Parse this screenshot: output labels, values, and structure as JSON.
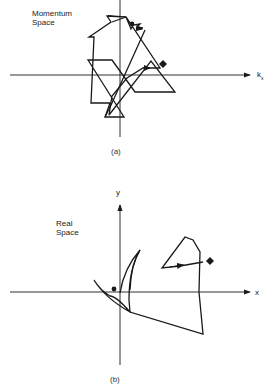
{
  "panel_a": {
    "title_line1": "Momentum",
    "title_line2": "Space",
    "x_axis_label": "k",
    "x_axis_subscript": "x",
    "caption": "(a)",
    "start_marker": "filled-circle",
    "end_marker": "filled-diamond"
  },
  "panel_b": {
    "title_line1": "Real",
    "title_line2": "Space",
    "x_axis_label": "x",
    "y_axis_label": "y",
    "caption": "(b)",
    "start_marker": "filled-circle",
    "end_marker": "filled-diamond"
  },
  "colors": {
    "line": "#1a1a1a",
    "background": "#ffffff"
  }
}
